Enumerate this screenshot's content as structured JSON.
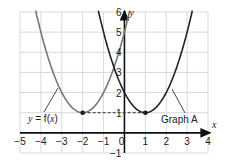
{
  "chart_data": {
    "type": "line",
    "title": "",
    "xlabel": "x",
    "ylabel": "y",
    "xlim": [
      -5,
      4
    ],
    "ylim": [
      -1,
      6
    ],
    "grid": true,
    "x_ticks": [
      "−5",
      "−4",
      "−3",
      "−2",
      "−1",
      "0",
      "1",
      "2",
      "3",
      "4"
    ],
    "y_ticks": [
      "−1",
      "1",
      "2",
      "3",
      "4",
      "5",
      "6"
    ],
    "series": [
      {
        "name": "y = f(x)",
        "equation": "y = (x+2)^2 + 1",
        "vertex": [
          -2,
          1
        ],
        "color": "#777777"
      },
      {
        "name": "Graph A",
        "equation": "y = (x-1)^2 + 1",
        "vertex": [
          1,
          1
        ],
        "color": "#222222"
      }
    ],
    "annotations": [
      {
        "text": "y = f(x)",
        "points_to": [
          -3.2,
          2.4
        ]
      },
      {
        "text": "Graph A",
        "points_to": [
          2.2,
          2.4
        ]
      },
      {
        "type": "dashed-line",
        "from": [
          -2,
          1
        ],
        "to": [
          1,
          1
        ]
      }
    ]
  },
  "labels": {
    "fx_pre": "y",
    "fx_mid": " = f(",
    "fx_x": "x",
    "fx_post": ")",
    "graphA": "Graph A",
    "x_axis": "x",
    "y_axis": "y"
  }
}
